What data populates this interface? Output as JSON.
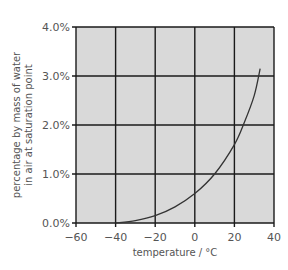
{
  "chart_data": {
    "type": "line",
    "title": "",
    "xlabel": "temperature / °C",
    "ylabel_line1": "percentage by mass of water",
    "ylabel_line2": "in air at saturation point",
    "xlim": [
      -60,
      40
    ],
    "ylim": [
      0,
      4.0
    ],
    "grid": true,
    "background": "#d9d9d9",
    "line_color": "#333333",
    "x_ticks": [
      "−60",
      "−40",
      "−20",
      "0",
      "20",
      "40"
    ],
    "y_ticks": [
      "0.0%",
      "1.0%",
      "2.0%",
      "3.0%",
      "4.0%"
    ],
    "series": [
      {
        "name": "saturation water content",
        "x": [
          -40,
          -30,
          -20,
          -10,
          0,
          10,
          20,
          25,
          30,
          33
        ],
        "values": [
          0.0,
          0.05,
          0.15,
          0.33,
          0.6,
          1.0,
          1.6,
          2.05,
          2.6,
          3.15
        ]
      }
    ]
  }
}
